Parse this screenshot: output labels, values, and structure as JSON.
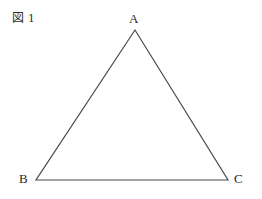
{
  "figure": {
    "caption_kanji": "図",
    "caption_number": "1",
    "caption_full": "図 1"
  },
  "diagram": {
    "type": "triangle",
    "stroke_color": "#4a4a4a",
    "stroke_width": 1.2,
    "fill": "none",
    "background": "#ffffff",
    "vertices": [
      {
        "label": "A",
        "x": 135,
        "y": 30
      },
      {
        "label": "B",
        "x": 36,
        "y": 180
      },
      {
        "label": "C",
        "x": 228,
        "y": 180
      }
    ],
    "edges": [
      {
        "name": "AB",
        "from": "A",
        "to": "B"
      },
      {
        "name": "BC",
        "from": "B",
        "to": "C"
      },
      {
        "name": "CA",
        "from": "C",
        "to": "A"
      }
    ],
    "points_attr": "135,30 36,180 228,180"
  }
}
